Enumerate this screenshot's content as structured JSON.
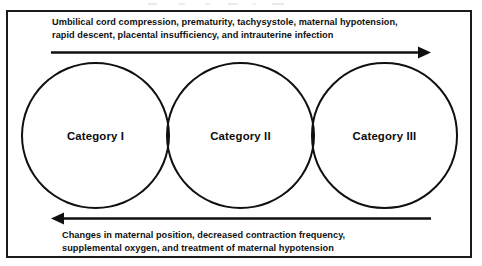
{
  "figure": {
    "top_caption": {
      "name": "deteriorating-factors-caption",
      "lines": [
        "Umbilical cord compression, prematurity, tachysystole, maternal hypotension,",
        "rapid descent, placental insufficiency, and intrauterine infection"
      ]
    },
    "bottom_caption": {
      "name": "resuscitative-measures-caption",
      "lines": [
        "Changes in maternal position, decreased contraction frequency,",
        "supplemental oxygen, and treatment of maternal hypotension"
      ]
    },
    "arrows": [
      {
        "name": "rightward-progression-arrow",
        "direction": "right",
        "meaning": "Worsening: Category I toward Category III"
      },
      {
        "name": "leftward-progression-arrow",
        "direction": "left",
        "meaning": "Improving: Category III toward Category I"
      }
    ],
    "circles": [
      {
        "label": "Category I",
        "name": "circle-category-1"
      },
      {
        "label": "Category II",
        "name": "circle-category-2"
      },
      {
        "label": "Category III",
        "name": "circle-category-3"
      }
    ],
    "colors": {
      "stroke": "#101010",
      "frame": "#1a1a1a",
      "text": "#111111",
      "background": "#ffffff"
    }
  }
}
